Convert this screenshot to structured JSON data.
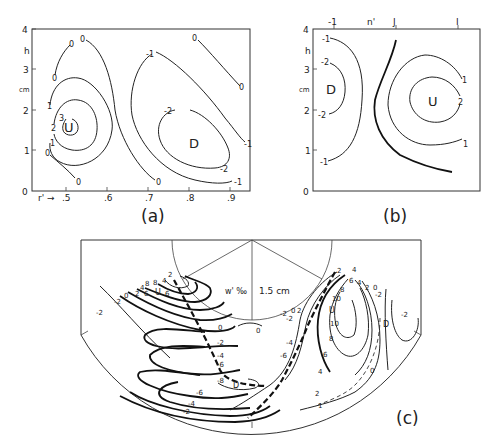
{
  "panels": {
    "a": {
      "label": "(a)",
      "y_axis": {
        "name_h": "h",
        "name_unit": "cm",
        "ticks": [
          "0",
          "1",
          "2",
          "3",
          "4"
        ]
      },
      "x_axis": {
        "prefix": "r'",
        "arrow": "→",
        "ticks": [
          ".5",
          ".6",
          ".7",
          ".8",
          ".9"
        ]
      },
      "centers": {
        "up": "U",
        "down": "D"
      },
      "contour_labels": {
        "up_3": "3",
        "up_2": "2",
        "up_1a": "1",
        "up_1b": "1",
        "zero_a": "0",
        "zero_b": "0",
        "zero_c": "0",
        "zero_d": "0",
        "zero_e": "0",
        "zero_f": "0",
        "zero_g": "0",
        "zero_h": "0",
        "neg1_a": "-1",
        "neg1_b": "-1",
        "neg1_c": "-1",
        "neg2_a": "-2",
        "neg2_b": "-2"
      }
    },
    "b": {
      "label": "(b)",
      "y_axis": {
        "name_h": "h",
        "name_unit": "cm",
        "ticks": [
          "0",
          "1",
          "2",
          "3",
          "4"
        ]
      },
      "top_ticks": [
        "-1",
        "n'",
        "J",
        "I"
      ],
      "centers": {
        "up": "U",
        "down": "D"
      },
      "contour_labels": {
        "neg1_a": "-1",
        "neg1_b": "-1",
        "neg2_a": "-2",
        "neg2_b": "-2",
        "pos1_a": "1",
        "pos1_b": "1",
        "pos2": "2"
      }
    },
    "c": {
      "label": "(c)",
      "quantity": "w' ‰",
      "scale": "1.5 cm",
      "centers": {
        "up_left": "U",
        "down_center": "D",
        "up_right": "U",
        "down_right": "D"
      },
      "contour_labels": {
        "l_neg2_a": "-2",
        "l_neg2_b": "-2",
        "l_0": "0",
        "l_2a": "2",
        "l_4a": "4",
        "l_6a": "6",
        "l_8a": "8",
        "l_8b": "8",
        "l_4b": "4",
        "l_6b": "6",
        "l_2b": "2",
        "m_0a": "0",
        "m_0b": "0",
        "m_neg2": "-2",
        "m_neg4": "-4",
        "m_neg6": "-6",
        "m_neg8": "-8",
        "m_neg6b": "-6",
        "m_neg4b": "-4",
        "m_neg2b": "-2",
        "r_neg2a": "-2",
        "r_neg2b": "-2",
        "r_0": "0",
        "r_2": "2",
        "r_neg4": "-4",
        "r_neg6": "-6",
        "u_2": "2",
        "u_4": "4",
        "u_6": "6",
        "u_4b": "4",
        "u_8": "8",
        "u_10a": "10",
        "u_10b": "10",
        "u_8b": "8",
        "u_6b": "6",
        "u_4c": "4",
        "u_2b": "2",
        "u_1": "1",
        "d_2": "2",
        "d_0": "0",
        "d_neg2": "-2",
        "d_neg2b": "-2",
        "d_0b": "0"
      }
    }
  }
}
